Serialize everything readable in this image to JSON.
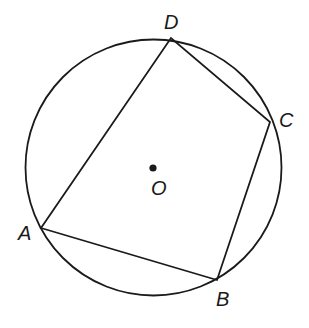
{
  "diagram": {
    "type": "inscribed-quadrilateral",
    "circle": {
      "center_label": "O",
      "cx": 153.5,
      "cy": 167.5,
      "r": 128
    },
    "vertices": [
      {
        "name": "A",
        "x": 41,
        "y": 228,
        "label": "A",
        "lx": 18,
        "ly": 240
      },
      {
        "name": "B",
        "x": 217,
        "y": 280,
        "label": "B",
        "lx": 216,
        "ly": 306
      },
      {
        "name": "C",
        "x": 270,
        "y": 122,
        "label": "C",
        "lx": 279,
        "ly": 127
      },
      {
        "name": "D",
        "x": 171,
        "y": 38,
        "label": "D",
        "lx": 164,
        "ly": 29
      }
    ],
    "center": {
      "label": "O",
      "x": 153,
      "y": 168,
      "lx": 151,
      "ly": 195
    },
    "colors": {
      "line": "#1a1a1a",
      "background": "#ffffff"
    }
  }
}
